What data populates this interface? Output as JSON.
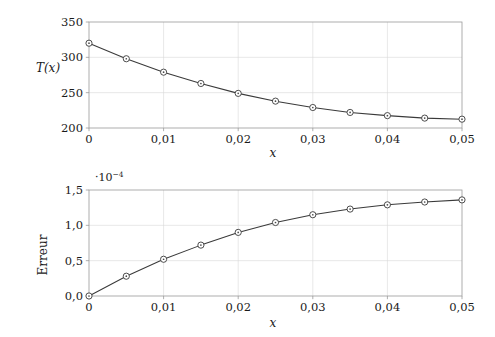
{
  "figure": {
    "name": "two-stacked-line-plots",
    "background": "#ffffff",
    "line_color": "#3a3a3a",
    "marker_face_color": "#ffffff",
    "grid_color": "#d8d8d8",
    "frame_color": "#9a9a9a"
  },
  "chart_data": [
    {
      "id": "temperature-profile",
      "type": "line",
      "title": "",
      "xlabel": "x",
      "ylabel": "T(x)",
      "xlim": [
        0,
        0.05
      ],
      "ylim": [
        200,
        350
      ],
      "grid": true,
      "legend": null,
      "x_ticklabels": [
        "0",
        "0,01",
        "0,02",
        "0,03",
        "0,04",
        "0,05"
      ],
      "x_tickvalues": [
        0,
        0.01,
        0.02,
        0.03,
        0.04,
        0.05
      ],
      "y_ticklabels": [
        "200",
        "250",
        "300",
        "350"
      ],
      "y_tickvalues": [
        200,
        250,
        300,
        350
      ],
      "y_exponent": "",
      "marker": "circle-with-dot",
      "x": [
        0,
        0.005,
        0.01,
        0.015,
        0.02,
        0.025,
        0.03,
        0.035,
        0.04,
        0.045,
        0.05
      ],
      "values": [
        320,
        298,
        279,
        263,
        249,
        238,
        229,
        222,
        217.5,
        214,
        212.5
      ]
    },
    {
      "id": "error-profile",
      "type": "line",
      "title": "",
      "xlabel": "x",
      "ylabel": "Erreur",
      "xlim": [
        0,
        0.05
      ],
      "ylim": [
        0,
        1.5
      ],
      "grid": true,
      "legend": null,
      "x_ticklabels": [
        "0",
        "0,01",
        "0,02",
        "0,03",
        "0,04",
        "0,05"
      ],
      "x_tickvalues": [
        0,
        0.01,
        0.02,
        0.03,
        0.04,
        0.05
      ],
      "y_ticklabels": [
        "0,0",
        "0,5",
        "1,0",
        "1,5"
      ],
      "y_tickvalues": [
        0,
        0.5,
        1.0,
        1.5
      ],
      "y_exponent_prefix": "·10",
      "y_exponent_power": "−4",
      "marker": "circle-with-dot",
      "x": [
        0,
        0.005,
        0.01,
        0.015,
        0.02,
        0.025,
        0.03,
        0.035,
        0.04,
        0.045,
        0.05
      ],
      "values": [
        0.0,
        0.28,
        0.52,
        0.72,
        0.9,
        1.04,
        1.15,
        1.23,
        1.29,
        1.33,
        1.36
      ]
    }
  ]
}
